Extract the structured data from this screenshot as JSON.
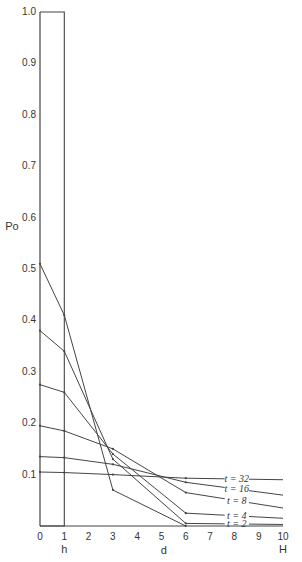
{
  "chart_data": {
    "type": "line",
    "title": "",
    "xlabel": "d",
    "ylabel": "Po",
    "xlim": [
      0,
      10
    ],
    "ylim": [
      0,
      1.0
    ],
    "grid": false,
    "x_ticks": [
      "0",
      "1",
      "2",
      "3",
      "4",
      "5",
      "6",
      "7",
      "8",
      "9",
      "10"
    ],
    "y_ticks": [
      "0.1",
      "0.2",
      "0.3",
      "0.4",
      "0.5",
      "0.6",
      "0.7",
      "0.8",
      "0.9",
      "1.0"
    ],
    "x_annotations": [
      {
        "x": 1,
        "text": "h"
      },
      {
        "x": 10,
        "text": "H"
      }
    ],
    "x": [
      0,
      1,
      3,
      6,
      10
    ],
    "series": [
      {
        "name": "t = 0",
        "points": [
          [
            0,
            1.0
          ],
          [
            1,
            1.0
          ],
          [
            1,
            0
          ],
          [
            0,
            0
          ]
        ]
      },
      {
        "name": "t = 1",
        "values": [
          0.51,
          0.41,
          0.07,
          0.0,
          0.0
        ]
      },
      {
        "name": "t = 2",
        "values": [
          0.38,
          0.34,
          0.13,
          0.005,
          0.003
        ]
      },
      {
        "name": "t = 4",
        "values": [
          0.275,
          0.26,
          0.14,
          0.025,
          0.015
        ]
      },
      {
        "name": "t = 8",
        "values": [
          0.195,
          0.185,
          0.15,
          0.065,
          0.035
        ]
      },
      {
        "name": "t = 16",
        "values": [
          0.135,
          0.133,
          0.12,
          0.085,
          0.06
        ]
      },
      {
        "name": "t = 32",
        "values": [
          0.105,
          0.104,
          0.1,
          0.093,
          0.09
        ]
      }
    ],
    "legend": {
      "position": "inline-right",
      "entries": [
        "t = 32",
        "t = 16",
        "t = 8",
        "t = 4",
        "t = 2"
      ]
    }
  }
}
